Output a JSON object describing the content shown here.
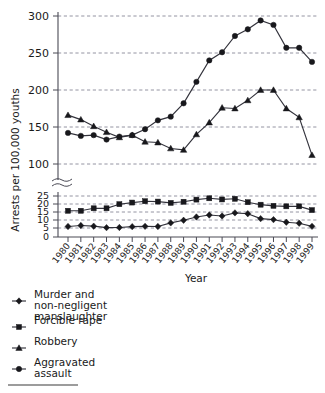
{
  "chart_data": {
    "type": "line",
    "title": "",
    "xlabel": "Year",
    "ylabel": "Arrests per 100,000 youths",
    "grid": true,
    "legend_position": "below",
    "note": "Broken y-axis: upper panel 100-300, lower panel 0-25",
    "categories": [
      "1980",
      "1981",
      "1982",
      "1983",
      "1984",
      "1985",
      "1986",
      "1987",
      "1988",
      "1989",
      "1990",
      "1991",
      "1992",
      "1993",
      "1994",
      "1995",
      "1996",
      "1997",
      "1998",
      "1999"
    ],
    "panels": [
      {
        "name": "upper",
        "ylim": [
          100,
          300
        ],
        "yticks": [
          100,
          150,
          200,
          250,
          300
        ],
        "series": [
          {
            "name": "Robbery",
            "marker": "triangle",
            "values": [
              166,
              160,
              151,
              143,
              136,
              139,
              130,
              129,
              121,
              119,
              140,
              156,
              176,
              175,
              186,
              200,
              200,
              175,
              163,
              112,
              97
            ]
          },
          {
            "name": "Aggravated assault",
            "marker": "circle",
            "values": [
              142,
              138,
              139,
              133,
              137,
              139,
              147,
              159,
              164,
              182,
              211,
              240,
              251,
              273,
              282,
              294,
              288,
              257,
              257,
              238,
              225
            ]
          }
        ]
      },
      {
        "name": "lower",
        "ylim": [
          0,
          25
        ],
        "yticks": [
          0,
          5,
          10,
          15,
          20,
          25
        ],
        "series": [
          {
            "name": "Forcible rape",
            "marker": "square",
            "values": [
              16.0,
              16.0,
              17.5,
              17.5,
              20.0,
              21.0,
              21.8,
              21.6,
              20.8,
              21.5,
              22.8,
              23.6,
              22.9,
              23.3,
              21.2,
              19.7,
              19.0,
              18.7,
              18.7,
              16.4
            ]
          },
          {
            "name": "Murder and non-negligent manslaughter",
            "marker": "diamond",
            "values": [
              6.4,
              7.0,
              6.6,
              5.7,
              5.8,
              6.3,
              6.5,
              6.4,
              8.6,
              10.2,
              12.2,
              13.4,
              12.8,
              14.7,
              14.2,
              11.2,
              10.6,
              9.0,
              8.4,
              6.5
            ]
          }
        ]
      }
    ],
    "legend": [
      {
        "label_line1": "Murder and",
        "label_line2": "non-negligent",
        "label_line3": "manslaughter",
        "marker": "diamond"
      },
      {
        "label_line1": "Forcible rape",
        "label_line2": "",
        "label_line3": "",
        "marker": "square"
      },
      {
        "label_line1": "Robbery",
        "label_line2": "",
        "label_line3": "",
        "marker": "triangle"
      },
      {
        "label_line1": "Aggravated",
        "label_line2": "assault",
        "label_line3": "",
        "marker": "circle"
      }
    ]
  },
  "axes": {
    "y_label": "Arrests per 100,000 youths",
    "x_label": "Year",
    "upper_ticks": [
      "300",
      "250",
      "200",
      "150",
      "100"
    ],
    "lower_ticks": [
      "25",
      "20",
      "15",
      "10",
      "5",
      "0"
    ],
    "year_labels": [
      "1980",
      "1981",
      "1982",
      "1983",
      "1984",
      "1985",
      "1986",
      "1987",
      "1988",
      "1989",
      "1990",
      "1991",
      "1992",
      "1993",
      "1994",
      "1995",
      "1996",
      "1997",
      "1998",
      "1999"
    ]
  },
  "legend_items": [
    {
      "l1": "Murder and",
      "l2": "non-negligent",
      "l3": "manslaughter"
    },
    {
      "l1": "Forcible rape",
      "l2": "",
      "l3": ""
    },
    {
      "l1": "Robbery",
      "l2": "",
      "l3": ""
    },
    {
      "l1": "Aggravated",
      "l2": "assault",
      "l3": ""
    }
  ],
  "colors": {
    "ink": "#18181c",
    "grid": "#7a7a8a",
    "axis": "#4a4a55",
    "background": "#ffffff"
  }
}
